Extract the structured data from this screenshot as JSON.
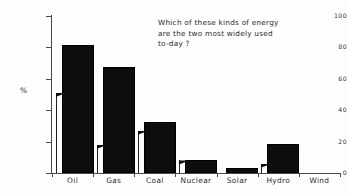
{
  "chart_data": {
    "type": "bar",
    "title": "Which of these kinds of energy are the two most widely used to-day ?",
    "title_lines": [
      "Which of these kinds of energy",
      "are the two most widely used",
      "to-day ?"
    ],
    "xlabel": "",
    "ylabel": "%",
    "categories": [
      "Oil",
      "Gas",
      "Coal",
      "Nuclear",
      "Solar",
      "Hydro",
      "Wind"
    ],
    "values": [
      80,
      66,
      31,
      7,
      2,
      17,
      0
    ],
    "ylim": [
      0,
      100
    ],
    "yticks": [
      0,
      20,
      40,
      60,
      80,
      100
    ],
    "ytick_labels": [
      "0",
      "20",
      "40",
      "60",
      "80",
      "100"
    ],
    "grid": false,
    "legend": "none",
    "bar_color": "#0d0d0d",
    "axis_color": "#4a4a4a",
    "background_color": "#fdfdfd",
    "annotations": [
      {
        "name": "pointer-oil",
        "category": "Oil",
        "value": 51
      },
      {
        "name": "pointer-gas",
        "category": "Gas",
        "value": 18
      },
      {
        "name": "pointer-coal",
        "category": "Coal",
        "value": 27
      },
      {
        "name": "pointer-nuclear",
        "category": "Nuclear",
        "value": 8
      },
      {
        "name": "pointer-hydro",
        "category": "Hydro",
        "value": 6
      }
    ]
  }
}
